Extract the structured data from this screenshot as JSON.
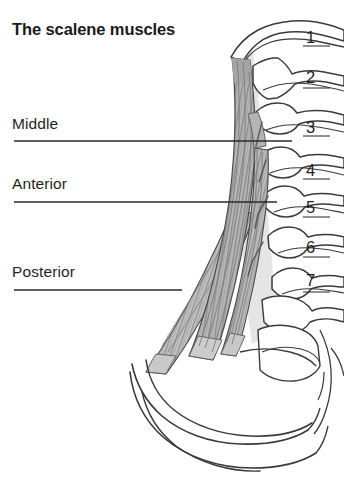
{
  "figure": {
    "title": "The scalene muscles",
    "width": 344,
    "height": 479,
    "background_color": "#ffffff",
    "line_color": "#3a3a3a",
    "muscle_fill_color": "#b2b2b2",
    "muscle_stripe_color": "#8a8a8a",
    "text_color": "#1f1f1f",
    "type": "anatomical-illustration"
  },
  "muscle_labels": [
    {
      "id": "middle",
      "text": "Middle",
      "leader_end_x": 292
    },
    {
      "id": "anterior",
      "text": "Anterior",
      "leader_end_x": 277
    },
    {
      "id": "posterior",
      "text": "Posterior",
      "leader_end_x": 182
    }
  ],
  "vertebra_numbers": [
    {
      "label": "1",
      "top": 28
    },
    {
      "label": "2",
      "top": 68
    },
    {
      "label": "3",
      "top": 118
    },
    {
      "label": "4",
      "top": 161
    },
    {
      "label": "5",
      "top": 198
    },
    {
      "label": "6",
      "top": 238
    },
    {
      "label": "7",
      "top": 271
    }
  ]
}
